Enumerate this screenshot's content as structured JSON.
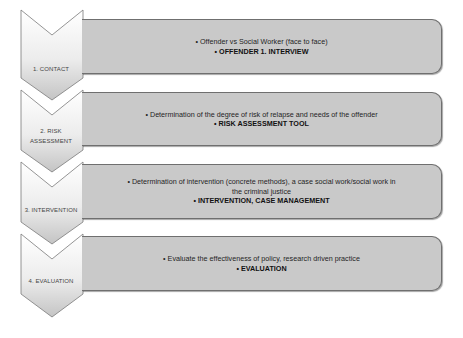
{
  "diagram": {
    "type": "vertical-chevron-process",
    "colors": {
      "box_fill": "#c9c9c9",
      "box_border": "#6f6f6f",
      "chevron_fill_top": "#ffffff",
      "chevron_fill_bottom": "#c4c4c4",
      "chevron_border": "#7a7a7a",
      "text": "#1f1f1f"
    },
    "steps": [
      {
        "label": "1. CONTACT",
        "label_lines": [
          "1. CONTACT"
        ],
        "bullets": [
          {
            "text": "• Offender vs Social Worker (face to face)",
            "bold": false
          },
          {
            "text": "• OFFENDER 1. INTERVIEW",
            "bold": true
          }
        ]
      },
      {
        "label": "2. RISK ASSESSMENT",
        "label_lines": [
          "2. RISK",
          "ASSESSMENT"
        ],
        "bullets": [
          {
            "text": "• Determination of the degree of risk of relapse and needs of the offender",
            "bold": false
          },
          {
            "text": "• RISK ASSESSMENT TOOL",
            "bold": true
          }
        ]
      },
      {
        "label": "3. INTERVENTION",
        "label_lines": [
          "3. INTERVENTION"
        ],
        "bullets": [
          {
            "text": "• Determination of intervention (concrete methods), a case social work/social work in",
            "bold": false
          },
          {
            "text": "the criminal justice",
            "bold": false
          },
          {
            "text": "• INTERVENTION, CASE MANAGEMENT",
            "bold": true
          }
        ]
      },
      {
        "label": "4. EVALUATION",
        "label_lines": [
          "4. EVALUATION"
        ],
        "bullets": [
          {
            "text": "• Evaluate the effectiveness of policy, research driven practice",
            "bold": false
          },
          {
            "text": "• EVALUATION",
            "bold": true
          }
        ]
      }
    ]
  }
}
